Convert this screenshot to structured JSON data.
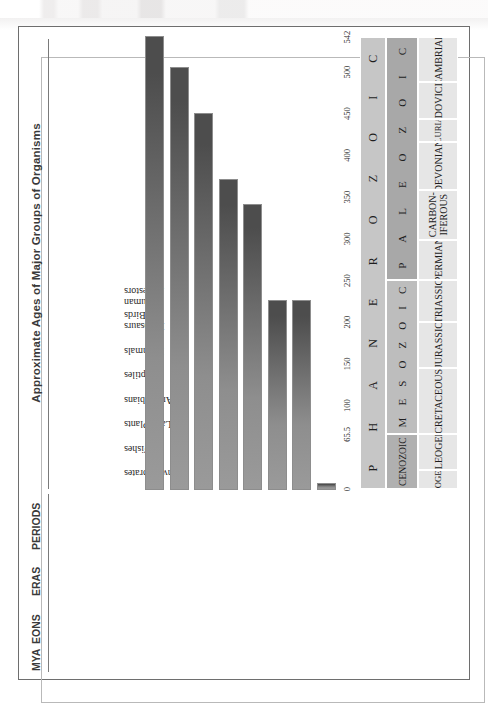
{
  "page": {
    "title": "Approximate Ages of Major Groups of Organisms",
    "headers": {
      "mya": "MYA",
      "eons": "EONS",
      "eras": "ERAS",
      "periods": "PERIODS"
    }
  },
  "chart_data": {
    "type": "bar",
    "title": "Approximate Ages of Major Groups of Organisms",
    "xlabel": "MYA",
    "ylabel": "",
    "orientation": "horizontal",
    "xlim": [
      0,
      542
    ],
    "x_reversed": true,
    "grid": false,
    "legend": "none",
    "axis_ticks": [
      "0",
      "65.5",
      "100",
      "150",
      "200",
      "250",
      "300",
      "350",
      "400",
      "450",
      "500",
      "542"
    ],
    "axis_tick_values": [
      0,
      65.5,
      100,
      150,
      200,
      250,
      300,
      350,
      400,
      450,
      500,
      542
    ],
    "categories": [
      "Invertebrates",
      "Fishes",
      "Land Plants",
      "Amphibians",
      "Reptiles",
      "Mammals",
      "Dinosaurs & Birds",
      "Human Ancestors"
    ],
    "values": [
      542,
      505,
      450,
      370,
      340,
      225,
      225,
      6
    ],
    "bars": [
      {
        "label": "Invertebrates",
        "label_line1": "Invertebrates",
        "label_line2": "",
        "start_mya": 542,
        "end_mya": 0
      },
      {
        "label": "Fishes",
        "label_line1": "Fishes",
        "label_line2": "",
        "start_mya": 505,
        "end_mya": 0
      },
      {
        "label": "Land Plants",
        "label_line1": "Land Plants",
        "label_line2": "",
        "start_mya": 450,
        "end_mya": 0
      },
      {
        "label": "Amphibians",
        "label_line1": "Amphibians",
        "label_line2": "",
        "start_mya": 370,
        "end_mya": 0
      },
      {
        "label": "Reptiles",
        "label_line1": "Reptiles",
        "label_line2": "",
        "start_mya": 340,
        "end_mya": 0
      },
      {
        "label": "Mammals",
        "label_line1": "Mammals",
        "label_line2": "",
        "start_mya": 225,
        "end_mya": 0
      },
      {
        "label": "Dinosaurs & Birds",
        "label_line1": "Dinosaurs",
        "label_line2": "& Birds",
        "start_mya": 225,
        "end_mya": 0
      },
      {
        "label": "Human Ancestors",
        "label_line1": "Human",
        "label_line2": "Ancestors",
        "start_mya": 6,
        "end_mya": 0
      }
    ]
  },
  "timescale": {
    "eons": [
      {
        "name": "PHANEROZOIC",
        "letters": [
          "P",
          "H",
          "A",
          "N",
          "E",
          "R",
          "O",
          "Z",
          "O",
          "I",
          "C"
        ],
        "start_mya": 542,
        "end_mya": 0
      },
      {
        "name": "Proterozoic",
        "letters": [],
        "start_mya": 2500,
        "end_mya": 542
      }
    ],
    "eras": [
      {
        "name": "CENOZOIC",
        "display": "CENOZOIC",
        "letters": [],
        "start_mya": 65.5,
        "end_mya": 0
      },
      {
        "name": "MESOZOIC",
        "display": "",
        "letters": [
          "M",
          "E",
          "S",
          "O",
          "Z",
          "O",
          "I",
          "C"
        ],
        "start_mya": 251,
        "end_mya": 65.5
      },
      {
        "name": "PALEOZOIC",
        "display": "",
        "letters": [
          "P",
          "A",
          "L",
          "E",
          "O",
          "Z",
          "O",
          "I",
          "C"
        ],
        "start_mya": 542,
        "end_mya": 251
      }
    ],
    "periods": [
      {
        "name": "NEOGENE",
        "line1": "NEOGENE",
        "line2": "",
        "start_mya": 23,
        "end_mya": 0
      },
      {
        "name": "PALEOGENE",
        "line1": "PALEOGENE",
        "line2": "",
        "start_mya": 65.5,
        "end_mya": 23
      },
      {
        "name": "CRETACEOUS",
        "line1": "CRETACEOUS",
        "line2": "",
        "start_mya": 145,
        "end_mya": 65.5
      },
      {
        "name": "JURASSIC",
        "line1": "JURASSIC",
        "line2": "",
        "start_mya": 200,
        "end_mya": 145
      },
      {
        "name": "TRIASSIC",
        "line1": "TRIASSIC",
        "line2": "",
        "start_mya": 251,
        "end_mya": 200
      },
      {
        "name": "PERMIAN",
        "line1": "PERMIAN",
        "line2": "",
        "start_mya": 299,
        "end_mya": 251
      },
      {
        "name": "CARBONIFEROUS",
        "line1": "CARBON-",
        "line2": "IFEROUS",
        "start_mya": 359,
        "end_mya": 299
      },
      {
        "name": "DEVONIAN",
        "line1": "DEVONIAN",
        "line2": "",
        "start_mya": 416,
        "end_mya": 359
      },
      {
        "name": "SILURIAN",
        "line1": "SILURIAN",
        "line2": "",
        "start_mya": 444,
        "end_mya": 416
      },
      {
        "name": "ORDOVICIAN",
        "line1": "ORDOVICIAN",
        "line2": "",
        "start_mya": 488,
        "end_mya": 444
      },
      {
        "name": "CAMBRIAN",
        "line1": "CAMBRIAN",
        "line2": "",
        "start_mya": 542,
        "end_mya": 488
      },
      {
        "name": "Precambrian",
        "line1": "Precambrian",
        "line2": "",
        "start_mya": 2500,
        "end_mya": 542
      }
    ]
  },
  "colors": {
    "bar_light": "#9a9a9a",
    "bar_dark": "#4d4d4d",
    "eon_band": "#c6c6c6",
    "era_band": "#b0b0b0",
    "period_band": "#e6e6e6",
    "precambrian_band": "#bcbcbc",
    "frame": "#6e6e6e",
    "text": "#2b2b2b"
  }
}
